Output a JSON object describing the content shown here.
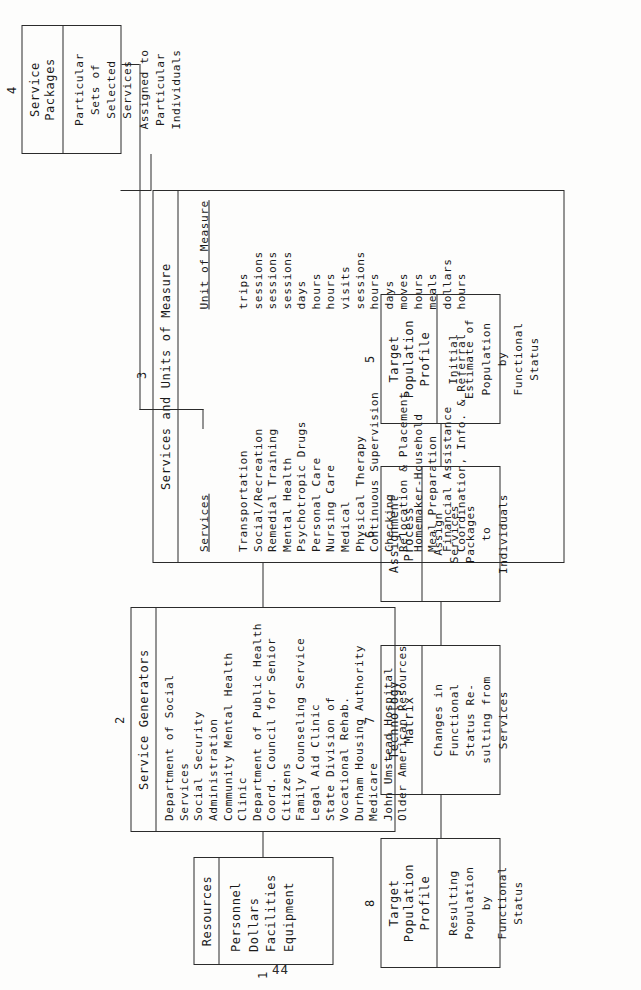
{
  "page": {
    "number": "44"
  },
  "boxes": {
    "b1": {
      "number": "1",
      "title": "Resources",
      "items": "Personnel\nDollars\nFacilities\nEquipment"
    },
    "b2": {
      "number": "2",
      "title": "Service Generators",
      "items": "Department of Social Services\nSocial Security Administration\nCommunity Mental Health Clinic\nDepartment of Public Health\nCoord. Council for Senior Citizens\nFamily Counseling Service\nLegal Aid Clinic\nState Division of Vocational Rehab.\nDurham Housing Authority\nMedicare\nJohn Umstead Hospital\nOlder American Resources"
    },
    "b3": {
      "number": "3",
      "title": "Services and Units of Measure",
      "col_services_header": "Services",
      "col_units_header": "Unit of Measure",
      "rows": [
        {
          "service": "Transportation",
          "unit": "trips"
        },
        {
          "service": "Social/Recreation",
          "unit": "sessions"
        },
        {
          "service": "Remedial Training",
          "unit": "sessions"
        },
        {
          "service": "Mental Health",
          "unit": "sessions"
        },
        {
          "service": "Psychotropic Drugs",
          "unit": "days"
        },
        {
          "service": "Personal Care",
          "unit": "hours"
        },
        {
          "service": "Nursing Care",
          "unit": "hours"
        },
        {
          "service": "Medical",
          "unit": "visits"
        },
        {
          "service": "Physical Therapy",
          "unit": "sessions"
        },
        {
          "service": "Continuous Supervision",
          "unit": "hours"
        },
        {
          "service": "Checking",
          "unit": "days"
        },
        {
          "service": "Relocation & Placement",
          "unit": "moves"
        },
        {
          "service": "Homemaker-Household",
          "unit": "hours"
        },
        {
          "service": "Meal Preparation",
          "unit": "meals"
        },
        {
          "service": "Financial Assistance",
          "unit": "dollars"
        },
        {
          "service": "Coordination, Info. & Referral",
          "unit": "hours"
        }
      ],
      "services_text": "Transportation\nSocial/Recreation\nRemedial Training\nMental Health\nPsychotropic Drugs\nPersonal Care\nNursing Care\nMedical\nPhysical Therapy\nContinuous Supervision\nChecking\nRelocation & Placement\nHomemaker-Household\nMeal Preparation\nFinancial Assistance\nCoordination, Info. & Referral",
      "units_text": "trips\nsessions\nsessions\nsessions\ndays\nhours\nhours\nvisits\nsessions\nhours\ndays\nmoves\nhours\nmeals\ndollars\nhours"
    },
    "b4": {
      "number": "4",
      "title": "Service\nPackages",
      "items": "Particular\nSets of\nSelected\nServices\nAssigned to\nParticular\nIndividuals"
    },
    "b5": {
      "number": "5",
      "title": "Target\nPopulation\nProfile",
      "items": "Initial\nEstimate of\nPopulation\nby\nFunctional\nStatus"
    },
    "b6": {
      "number": "6",
      "title": "Assignment\nProcess",
      "items": "Assign\nServices\nPackages\nto\nIndividuals"
    },
    "b7": {
      "number": "7",
      "title": "Technology\nMatrix",
      "items": "Changes in\nFunctional\nStatus Re-\nsulting from\nServices"
    },
    "b8": {
      "number": "8",
      "title": "Target\nPopulation\nProfile",
      "items": "Resulting\nPopulation\nby\nFunctional\nStatus"
    }
  }
}
